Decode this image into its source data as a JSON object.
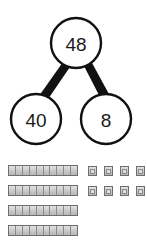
{
  "diagram": {
    "type": "number-bond",
    "background_color": "#ffffff",
    "stroke_color": "#1a1a1a",
    "nodes": {
      "whole": {
        "value": "48",
        "name": "whole",
        "cx": 76,
        "cy": 43,
        "r": 26
      },
      "part_left": {
        "value": "40",
        "name": "part-tens",
        "cx": 36,
        "cy": 119,
        "r": 26
      },
      "part_right": {
        "value": "8",
        "name": "part-ones",
        "cx": 105,
        "cy": 119,
        "r": 26
      }
    },
    "connectors": [
      {
        "name": "whole-to-left",
        "from": "whole",
        "to": "part_left"
      },
      {
        "name": "whole-to-right",
        "from": "whole",
        "to": "part_right"
      }
    ]
  },
  "manipulatives": {
    "tens": {
      "label": "ten-rods",
      "rod_count": 4,
      "segments_per_rod": 10,
      "total_value": 40,
      "rows": [
        {
          "name": "ten-rod",
          "left": 8,
          "top": 5,
          "width": 70
        },
        {
          "name": "ten-rod",
          "left": 8,
          "top": 25,
          "width": 70
        },
        {
          "name": "ten-rod",
          "left": 8,
          "top": 45,
          "width": 70
        },
        {
          "name": "ten-rod",
          "left": 8,
          "top": 65,
          "width": 70
        }
      ],
      "fill_color": "#cdcdcd",
      "stroke_color": "#6e6e6e"
    },
    "ones": {
      "label": "unit-cubes",
      "cube_count": 8,
      "total_value": 8,
      "rows": [
        {
          "cubes": [
            {
              "left": 88
            },
            {
              "left": 104
            },
            {
              "left": 120
            },
            {
              "left": 136
            }
          ],
          "top": 6
        },
        {
          "cubes": [
            {
              "left": 88
            },
            {
              "left": 104
            },
            {
              "left": 120
            },
            {
              "left": 136
            }
          ],
          "top": 26
        }
      ],
      "fill_color": "#cdcdcd",
      "stroke_color": "#6e6e6e"
    }
  }
}
